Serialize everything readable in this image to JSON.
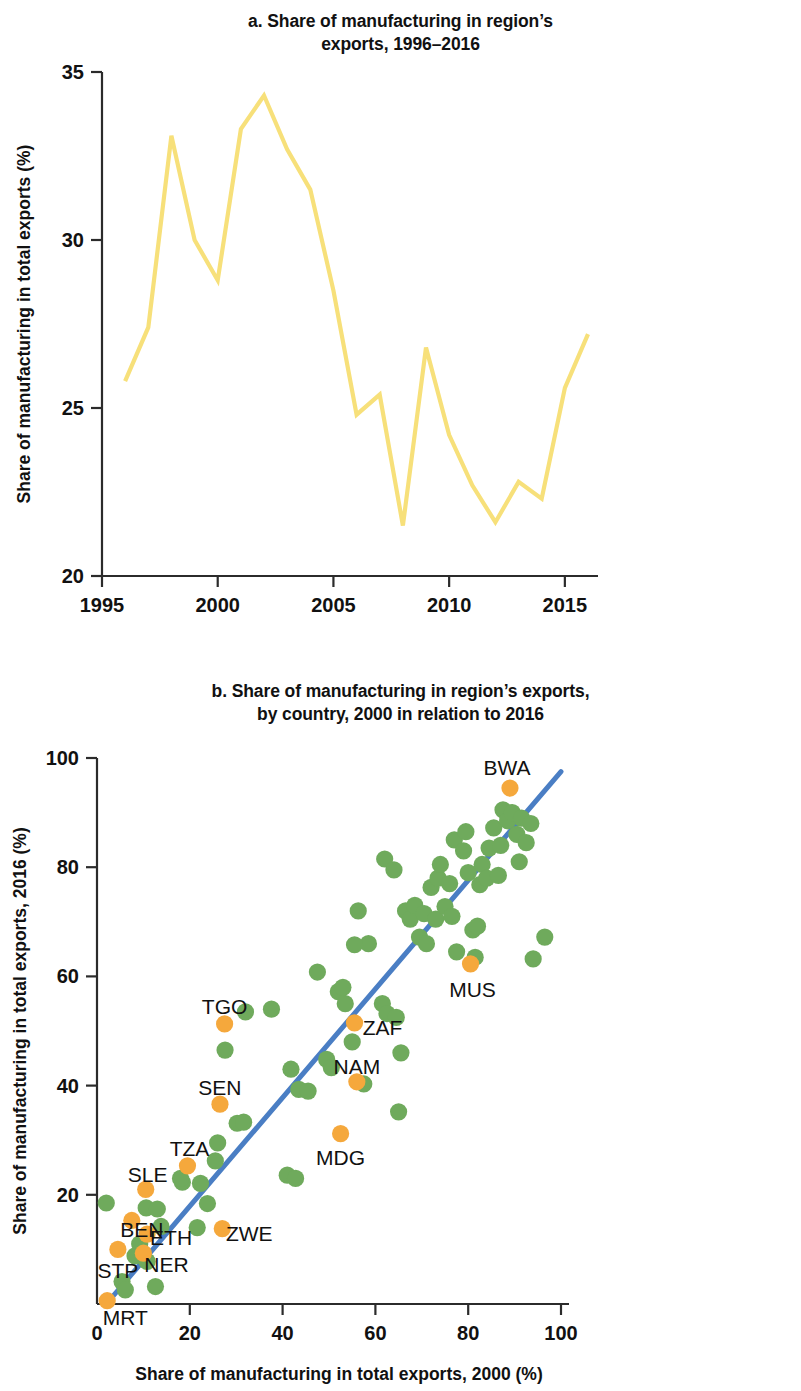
{
  "colors": {
    "line_yellow": "#F7E07A",
    "point_green": "#6FAA5C",
    "point_orange": "#F5A83C",
    "trend_blue": "#4A7EC4",
    "axis": "#2b2b2b",
    "text": "#111111",
    "background": "#ffffff"
  },
  "panel_a": {
    "title_line1": "a. Share of manufacturing in region’s",
    "title_line2": "exports, 1996–2016",
    "chart_data": {
      "type": "line",
      "title": "a. Share of manufacturing in region’s exports, 1996–2016",
      "xlabel": "",
      "ylabel": "Share of manufacturing in total exports (%)",
      "xlim": [
        1995,
        2016
      ],
      "ylim": [
        20,
        35
      ],
      "xticks": [
        1995,
        2000,
        2005,
        2010,
        2015
      ],
      "yticks": [
        20,
        25,
        30,
        35
      ],
      "grid": false,
      "legend": "none",
      "series": [
        {
          "name": "Share of manufacturing in total exports",
          "color": "#F7E07A",
          "x": [
            1996,
            1997,
            1998,
            1999,
            2000,
            2001,
            2002,
            2003,
            2004,
            2005,
            2006,
            2007,
            2008,
            2009,
            2010,
            2011,
            2012,
            2013,
            2014,
            2015,
            2016
          ],
          "values": [
            25.8,
            27.4,
            33.1,
            30.0,
            28.8,
            33.3,
            34.3,
            32.7,
            31.5,
            28.5,
            24.8,
            25.4,
            21.5,
            26.8,
            24.2,
            22.7,
            21.6,
            22.8,
            22.3,
            25.6,
            27.2
          ]
        }
      ]
    }
  },
  "panel_b": {
    "title_line1": "b. Share of manufacturing in region’s exports,",
    "title_line2": "by country, 2000 in relation to 2016",
    "chart_data": {
      "type": "scatter",
      "title": "b. Share of manufacturing in region’s exports, by country, 2000 in relation to 2016",
      "xlabel": "Share of manufacturing in total exports, 2000 (%)",
      "ylabel": "Share of manufacturing in total exports, 2016 (%)",
      "xlim": [
        0,
        100
      ],
      "ylim": [
        0,
        100
      ],
      "xticks": [
        0,
        20,
        40,
        60,
        80,
        100
      ],
      "yticks": [
        0,
        20,
        40,
        60,
        80,
        100
      ],
      "grid": false,
      "legend": "none",
      "trend_line": {
        "name": "fit line",
        "color": "#4A7EC4",
        "x0": 2.0,
        "y0": 0.0,
        "x1": 100.0,
        "y1": 97.5
      },
      "labeled_points": [
        {
          "label": "BWA",
          "x": 89.0,
          "y": 94.5,
          "color": "#F5A83C",
          "label_dx": -3,
          "label_dy": -20
        },
        {
          "label": "MUS",
          "x": 80.5,
          "y": 62.3,
          "color": "#F5A83C",
          "label_dx": 2,
          "label_dy": 26
        },
        {
          "label": "ZAF",
          "x": 55.5,
          "y": 51.5,
          "color": "#F5A83C",
          "label_dx": 28,
          "label_dy": 5
        },
        {
          "label": "NAM",
          "x": 56.0,
          "y": 40.7,
          "color": "#F5A83C",
          "label_dx": 0,
          "label_dy": -15
        },
        {
          "label": "MDG",
          "x": 52.5,
          "y": 31.2,
          "color": "#F5A83C",
          "label_dx": 0,
          "label_dy": 24
        },
        {
          "label": "TGO",
          "x": 27.5,
          "y": 51.3,
          "color": "#F5A83C",
          "label_dx": 0,
          "label_dy": -17
        },
        {
          "label": "SEN",
          "x": 26.5,
          "y": 36.6,
          "color": "#F5A83C",
          "label_dx": 0,
          "label_dy": -16
        },
        {
          "label": "TZA",
          "x": 19.5,
          "y": 25.3,
          "color": "#F5A83C",
          "label_dx": 2,
          "label_dy": -17
        },
        {
          "label": "SLE",
          "x": 10.5,
          "y": 21.0,
          "color": "#F5A83C",
          "label_dx": 2,
          "label_dy": -14
        },
        {
          "label": "BEN",
          "x": 7.5,
          "y": 15.3,
          "color": "#F5A83C",
          "label_dx": 10,
          "label_dy": 10
        },
        {
          "label": "ETH",
          "x": 10.8,
          "y": 12.8,
          "color": "#F5A83C",
          "label_dx": 24,
          "label_dy": 4
        },
        {
          "label": "NER",
          "x": 10.0,
          "y": 9.3,
          "color": "#F5A83C",
          "label_dx": 23,
          "label_dy": 12
        },
        {
          "label": "STP",
          "x": 4.5,
          "y": 10.0,
          "color": "#F5A83C",
          "label_dx": 0,
          "label_dy": 22
        },
        {
          "label": "MRT",
          "x": 2.2,
          "y": 0.6,
          "color": "#F5A83C",
          "label_dx": 18,
          "label_dy": 17
        },
        {
          "label": "ZWE",
          "x": 27.0,
          "y": 13.8,
          "color": "#F5A83C",
          "label_dx": 27,
          "label_dy": 5
        }
      ],
      "unlabeled_points": [
        {
          "x": 2.0,
          "y": 18.5,
          "color": "#6FAA5C"
        },
        {
          "x": 10.6,
          "y": 17.6,
          "color": "#6FAA5C"
        },
        {
          "x": 13.0,
          "y": 17.4,
          "color": "#6FAA5C"
        },
        {
          "x": 9.2,
          "y": 11.0,
          "color": "#6FAA5C"
        },
        {
          "x": 8.2,
          "y": 8.8,
          "color": "#6FAA5C"
        },
        {
          "x": 10.8,
          "y": 7.8,
          "color": "#6FAA5C"
        },
        {
          "x": 5.4,
          "y": 4.1,
          "color": "#6FAA5C"
        },
        {
          "x": 6.1,
          "y": 2.6,
          "color": "#6FAA5C"
        },
        {
          "x": 12.6,
          "y": 3.2,
          "color": "#6FAA5C"
        },
        {
          "x": 13.8,
          "y": 14.2,
          "color": "#6FAA5C"
        },
        {
          "x": 18.4,
          "y": 22.3,
          "color": "#6FAA5C"
        },
        {
          "x": 18.0,
          "y": 23.0,
          "color": "#6FAA5C"
        },
        {
          "x": 22.3,
          "y": 22.1,
          "color": "#6FAA5C"
        },
        {
          "x": 21.6,
          "y": 14.0,
          "color": "#6FAA5C"
        },
        {
          "x": 23.8,
          "y": 18.4,
          "color": "#6FAA5C"
        },
        {
          "x": 25.5,
          "y": 26.2,
          "color": "#6FAA5C"
        },
        {
          "x": 26.0,
          "y": 29.5,
          "color": "#6FAA5C"
        },
        {
          "x": 27.6,
          "y": 46.5,
          "color": "#6FAA5C"
        },
        {
          "x": 30.2,
          "y": 33.1,
          "color": "#6FAA5C"
        },
        {
          "x": 31.6,
          "y": 33.3,
          "color": "#6FAA5C"
        },
        {
          "x": 32.0,
          "y": 53.5,
          "color": "#6FAA5C"
        },
        {
          "x": 37.6,
          "y": 54.0,
          "color": "#6FAA5C"
        },
        {
          "x": 41.0,
          "y": 23.6,
          "color": "#6FAA5C"
        },
        {
          "x": 42.8,
          "y": 23.0,
          "color": "#6FAA5C"
        },
        {
          "x": 41.8,
          "y": 43.0,
          "color": "#6FAA5C"
        },
        {
          "x": 43.5,
          "y": 39.3,
          "color": "#6FAA5C"
        },
        {
          "x": 45.5,
          "y": 39.0,
          "color": "#6FAA5C"
        },
        {
          "x": 47.5,
          "y": 60.8,
          "color": "#6FAA5C"
        },
        {
          "x": 49.5,
          "y": 44.8,
          "color": "#6FAA5C"
        },
        {
          "x": 50.5,
          "y": 43.3,
          "color": "#6FAA5C"
        },
        {
          "x": 52.0,
          "y": 57.2,
          "color": "#6FAA5C"
        },
        {
          "x": 53.5,
          "y": 55.0,
          "color": "#6FAA5C"
        },
        {
          "x": 53.0,
          "y": 58.0,
          "color": "#6FAA5C"
        },
        {
          "x": 55.0,
          "y": 48.0,
          "color": "#6FAA5C"
        },
        {
          "x": 57.5,
          "y": 40.3,
          "color": "#6FAA5C"
        },
        {
          "x": 56.3,
          "y": 72.0,
          "color": "#6FAA5C"
        },
        {
          "x": 58.5,
          "y": 66.0,
          "color": "#6FAA5C"
        },
        {
          "x": 55.5,
          "y": 65.8,
          "color": "#6FAA5C"
        },
        {
          "x": 61.5,
          "y": 55.0,
          "color": "#6FAA5C"
        },
        {
          "x": 62.5,
          "y": 53.2,
          "color": "#6FAA5C"
        },
        {
          "x": 64.5,
          "y": 52.5,
          "color": "#6FAA5C"
        },
        {
          "x": 65.0,
          "y": 35.2,
          "color": "#6FAA5C"
        },
        {
          "x": 65.5,
          "y": 46.0,
          "color": "#6FAA5C"
        },
        {
          "x": 62.0,
          "y": 81.5,
          "color": "#6FAA5C"
        },
        {
          "x": 64.0,
          "y": 79.5,
          "color": "#6FAA5C"
        },
        {
          "x": 66.5,
          "y": 72.0,
          "color": "#6FAA5C"
        },
        {
          "x": 67.5,
          "y": 70.5,
          "color": "#6FAA5C"
        },
        {
          "x": 68.5,
          "y": 73.0,
          "color": "#6FAA5C"
        },
        {
          "x": 69.5,
          "y": 67.2,
          "color": "#6FAA5C"
        },
        {
          "x": 70.5,
          "y": 71.5,
          "color": "#6FAA5C"
        },
        {
          "x": 71.0,
          "y": 66.0,
          "color": "#6FAA5C"
        },
        {
          "x": 72.0,
          "y": 76.3,
          "color": "#6FAA5C"
        },
        {
          "x": 73.0,
          "y": 70.5,
          "color": "#6FAA5C"
        },
        {
          "x": 73.5,
          "y": 78.0,
          "color": "#6FAA5C"
        },
        {
          "x": 74.0,
          "y": 80.5,
          "color": "#6FAA5C"
        },
        {
          "x": 75.0,
          "y": 72.8,
          "color": "#6FAA5C"
        },
        {
          "x": 76.0,
          "y": 77.0,
          "color": "#6FAA5C"
        },
        {
          "x": 76.5,
          "y": 71.0,
          "color": "#6FAA5C"
        },
        {
          "x": 77.5,
          "y": 64.5,
          "color": "#6FAA5C"
        },
        {
          "x": 77.0,
          "y": 85.0,
          "color": "#6FAA5C"
        },
        {
          "x": 79.0,
          "y": 83.0,
          "color": "#6FAA5C"
        },
        {
          "x": 79.5,
          "y": 86.5,
          "color": "#6FAA5C"
        },
        {
          "x": 80.0,
          "y": 79.0,
          "color": "#6FAA5C"
        },
        {
          "x": 81.5,
          "y": 63.5,
          "color": "#6FAA5C"
        },
        {
          "x": 81.0,
          "y": 68.5,
          "color": "#6FAA5C"
        },
        {
          "x": 82.0,
          "y": 69.2,
          "color": "#6FAA5C"
        },
        {
          "x": 82.5,
          "y": 76.8,
          "color": "#6FAA5C"
        },
        {
          "x": 83.0,
          "y": 80.5,
          "color": "#6FAA5C"
        },
        {
          "x": 84.0,
          "y": 78.0,
          "color": "#6FAA5C"
        },
        {
          "x": 84.5,
          "y": 83.5,
          "color": "#6FAA5C"
        },
        {
          "x": 85.5,
          "y": 87.2,
          "color": "#6FAA5C"
        },
        {
          "x": 86.5,
          "y": 78.5,
          "color": "#6FAA5C"
        },
        {
          "x": 87.0,
          "y": 84.0,
          "color": "#6FAA5C"
        },
        {
          "x": 87.5,
          "y": 90.5,
          "color": "#6FAA5C"
        },
        {
          "x": 88.5,
          "y": 88.5,
          "color": "#6FAA5C"
        },
        {
          "x": 89.5,
          "y": 90.0,
          "color": "#6FAA5C"
        },
        {
          "x": 90.5,
          "y": 86.0,
          "color": "#6FAA5C"
        },
        {
          "x": 91.0,
          "y": 81.0,
          "color": "#6FAA5C"
        },
        {
          "x": 91.5,
          "y": 89.0,
          "color": "#6FAA5C"
        },
        {
          "x": 92.5,
          "y": 84.5,
          "color": "#6FAA5C"
        },
        {
          "x": 93.5,
          "y": 88.0,
          "color": "#6FAA5C"
        },
        {
          "x": 94.0,
          "y": 63.2,
          "color": "#6FAA5C"
        },
        {
          "x": 96.5,
          "y": 67.2,
          "color": "#6FAA5C"
        }
      ]
    }
  }
}
